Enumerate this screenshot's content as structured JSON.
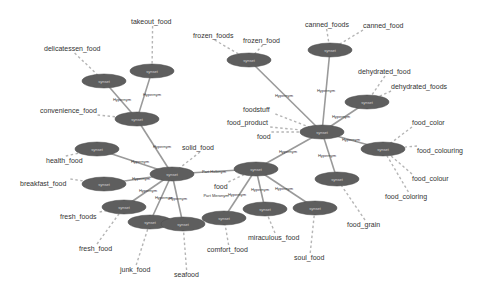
{
  "graph": {
    "nodes": [
      {
        "id": "takeout",
        "cx": 152,
        "cy": 71,
        "label": "synset"
      },
      {
        "id": "deli",
        "cx": 104,
        "cy": 81,
        "label": "synset"
      },
      {
        "id": "conv",
        "cx": 137,
        "cy": 119,
        "label": "synset"
      },
      {
        "id": "health",
        "cx": 97,
        "cy": 149,
        "label": "synset"
      },
      {
        "id": "break",
        "cx": 104,
        "cy": 184,
        "label": "synset"
      },
      {
        "id": "fresh",
        "cx": 124,
        "cy": 207,
        "label": "synset"
      },
      {
        "id": "solid",
        "cx": 172,
        "cy": 174,
        "label": "synset"
      },
      {
        "id": "junk",
        "cx": 150,
        "cy": 222,
        "label": "synset"
      },
      {
        "id": "sea",
        "cx": 183,
        "cy": 224,
        "label": "synset"
      },
      {
        "id": "food2",
        "cx": 256,
        "cy": 169,
        "label": "synset"
      },
      {
        "id": "comfort",
        "cx": 224,
        "cy": 218,
        "label": "synset"
      },
      {
        "id": "mirac",
        "cx": 265,
        "cy": 209,
        "label": "synset"
      },
      {
        "id": "soul",
        "cx": 315,
        "cy": 208,
        "label": "synset"
      },
      {
        "id": "main",
        "cx": 322,
        "cy": 132,
        "label": "synset"
      },
      {
        "id": "frozen",
        "cx": 249,
        "cy": 60,
        "label": "synset"
      },
      {
        "id": "canned",
        "cx": 330,
        "cy": 50,
        "label": "synset"
      },
      {
        "id": "dehyd",
        "cx": 367,
        "cy": 102,
        "label": "synset"
      },
      {
        "id": "color",
        "cx": 383,
        "cy": 149,
        "label": "synset"
      },
      {
        "id": "grain",
        "cx": 337,
        "cy": 179,
        "label": "synset"
      }
    ],
    "relations": [
      {
        "from": "takeout",
        "to": "conv",
        "label": "Hypernym",
        "lx": 152,
        "ly": 96
      },
      {
        "from": "deli",
        "to": "conv",
        "label": "Hypernym",
        "lx": 122,
        "ly": 101
      },
      {
        "from": "conv",
        "to": "solid",
        "label": "Hypernym",
        "lx": 162,
        "ly": 148
      },
      {
        "from": "health",
        "to": "solid",
        "label": "Hypernym",
        "lx": 140,
        "ly": 163
      },
      {
        "from": "break",
        "to": "solid",
        "label": "Hypernym",
        "lx": 141,
        "ly": 180
      },
      {
        "from": "fresh",
        "to": "solid",
        "label": "Hypernym",
        "lx": 148,
        "ly": 192
      },
      {
        "from": "junk",
        "to": "solid",
        "label": "Hypernym",
        "lx": 164,
        "ly": 199
      },
      {
        "from": "sea",
        "to": "solid",
        "label": "Hypernym",
        "lx": 178,
        "ly": 200
      },
      {
        "from": "solid",
        "to": "food2",
        "label": "Part Holonym",
        "lx": 214,
        "ly": 173
      },
      {
        "from": "comfort",
        "to": "food2",
        "label": "Hypernym",
        "lx": 237,
        "ly": 196
      },
      {
        "from": "mirac",
        "to": "food2",
        "label": "Hypernym",
        "lx": 260,
        "ly": 191
      },
      {
        "from": "soul",
        "to": "food2",
        "label": "Hypernym",
        "lx": 284,
        "ly": 190
      },
      {
        "from": "food2",
        "to": "main",
        "label": "Hypernym",
        "lx": 288,
        "ly": 153
      },
      {
        "from": "frozen",
        "to": "main",
        "label": "Hypernym",
        "lx": 284,
        "ly": 97
      },
      {
        "from": "canned",
        "to": "main",
        "label": "Hypernym",
        "lx": 326,
        "ly": 92
      },
      {
        "from": "dehyd",
        "to": "main",
        "label": "Hypernym",
        "lx": 341,
        "ly": 118
      },
      {
        "from": "color",
        "to": "main",
        "label": "Hypernym",
        "lx": 351,
        "ly": 141
      },
      {
        "from": "grain",
        "to": "main",
        "label": "Hypernym",
        "lx": 327,
        "ly": 157
      }
    ],
    "extra_edge_labels": [
      {
        "label": "Part Meronym",
        "x": 216,
        "y": 197
      }
    ],
    "lemmas": [
      {
        "node": "takeout",
        "text": "takeout_food",
        "x": 131,
        "y": 24
      },
      {
        "node": "deli",
        "text": "delicatessen_food",
        "x": 44,
        "y": 51
      },
      {
        "node": "conv",
        "text": "convenience_food",
        "x": 40,
        "y": 113
      },
      {
        "node": "health",
        "text": "health_food",
        "x": 46,
        "y": 163
      },
      {
        "node": "break",
        "text": "breakfast_food",
        "x": 20,
        "y": 186
      },
      {
        "node": "fresh",
        "text": "fresh_foods",
        "x": 60,
        "y": 219
      },
      {
        "node": "fresh",
        "text": "fresh_food",
        "x": 79,
        "y": 251
      },
      {
        "node": "solid",
        "text": "solid_food",
        "x": 182,
        "y": 150
      },
      {
        "node": "junk",
        "text": "junk_food",
        "x": 120,
        "y": 272
      },
      {
        "node": "sea",
        "text": "seafood",
        "x": 174,
        "y": 277
      },
      {
        "node": "food2",
        "text": "food",
        "x": 214,
        "y": 189
      },
      {
        "node": "main",
        "text": "food",
        "x": 257,
        "y": 139
      },
      {
        "node": "comfort",
        "text": "comfort_food",
        "x": 207,
        "y": 252
      },
      {
        "node": "mirac",
        "text": "miraculous_food",
        "x": 248,
        "y": 240
      },
      {
        "node": "soul",
        "text": "soul_food",
        "x": 294,
        "y": 260
      },
      {
        "node": "main",
        "text": "foodstuff",
        "x": 243,
        "y": 112
      },
      {
        "node": "main",
        "text": "food_product",
        "x": 227,
        "y": 125
      },
      {
        "node": "frozen",
        "text": "frozen_foods",
        "x": 193,
        "y": 38
      },
      {
        "node": "frozen",
        "text": "frozen_food",
        "x": 243,
        "y": 43
      },
      {
        "node": "canned",
        "text": "canned_foods",
        "x": 305,
        "y": 27
      },
      {
        "node": "canned",
        "text": "canned_food",
        "x": 363,
        "y": 28
      },
      {
        "node": "dehyd",
        "text": "dehydrated_food",
        "x": 358,
        "y": 74
      },
      {
        "node": "dehyd",
        "text": "dehydrated_foods",
        "x": 391,
        "y": 89
      },
      {
        "node": "color",
        "text": "food_color",
        "x": 412,
        "y": 125
      },
      {
        "node": "color",
        "text": "food_colouring",
        "x": 417,
        "y": 153
      },
      {
        "node": "color",
        "text": "food_colour",
        "x": 412,
        "y": 181
      },
      {
        "node": "color",
        "text": "food_coloring",
        "x": 385,
        "y": 199
      },
      {
        "node": "grain",
        "text": "food_grain",
        "x": 347,
        "y": 227
      }
    ],
    "colors": {
      "node_fill": "#5e5e5e",
      "edge": "#9a9a9a",
      "dashed": "#b5b5b5",
      "text": "#333333"
    }
  }
}
